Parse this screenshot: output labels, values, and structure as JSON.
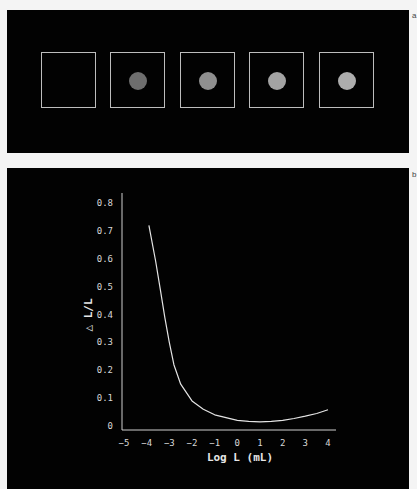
{
  "panels": {
    "a": {
      "label": "a",
      "stimuli": [
        {
          "has_dot": false,
          "dot_color": ""
        },
        {
          "has_dot": true,
          "dot_color": "#6e6e6e"
        },
        {
          "has_dot": true,
          "dot_color": "#8f8f8f"
        },
        {
          "has_dot": true,
          "dot_color": "#a3a3a3"
        },
        {
          "has_dot": true,
          "dot_color": "#adadad"
        }
      ]
    },
    "b": {
      "label": "b"
    }
  },
  "chart_data": {
    "type": "line",
    "title": "",
    "xlabel": "Log L (mL)",
    "ylabel": "△ L/L",
    "xlim": [
      -5,
      4
    ],
    "ylim": [
      0,
      0.8
    ],
    "xticks": [
      "-5",
      "-4",
      "-3",
      "-2",
      "-1",
      "0",
      "1",
      "2",
      "3",
      "4"
    ],
    "yticks": [
      "0",
      "0.1",
      "0.2",
      "0.3",
      "0.4",
      "0.5",
      "0.6",
      "0.7",
      "0.8"
    ],
    "grid": false,
    "legend": null,
    "series": [
      {
        "name": "Weber fraction",
        "x": [
          -3.9,
          -3.6,
          -3.4,
          -3.2,
          -3.0,
          -2.8,
          -2.5,
          -2.0,
          -1.5,
          -1.0,
          -0.5,
          0.0,
          0.5,
          1.0,
          1.5,
          2.0,
          2.5,
          3.0,
          3.5,
          4.0
        ],
        "y": [
          0.72,
          0.59,
          0.49,
          0.39,
          0.3,
          0.22,
          0.15,
          0.09,
          0.06,
          0.04,
          0.03,
          0.02,
          0.017,
          0.015,
          0.017,
          0.02,
          0.027,
          0.035,
          0.045,
          0.058
        ]
      }
    ],
    "line_color": "#e4e4e4",
    "background": "#020202"
  }
}
